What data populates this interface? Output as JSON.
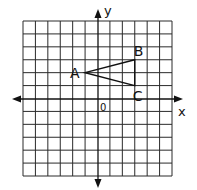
{
  "diagram": {
    "type": "coordinate-grid",
    "grid": {
      "columns": 12,
      "rows": 12,
      "x_range": [
        -6,
        6
      ],
      "y_range": [
        -6,
        6
      ],
      "origin_column": 6,
      "origin_row": 6
    },
    "axes": {
      "x_label": "x",
      "y_label": "y",
      "origin_label": "0"
    },
    "triangle": {
      "vertices": [
        {
          "label": "A",
          "x": -1,
          "y": 2
        },
        {
          "label": "B",
          "x": 3,
          "y": 3
        },
        {
          "label": "C",
          "x": 3,
          "y": 1
        }
      ]
    },
    "colors": {
      "line": "#111111",
      "background": "#ffffff"
    }
  }
}
